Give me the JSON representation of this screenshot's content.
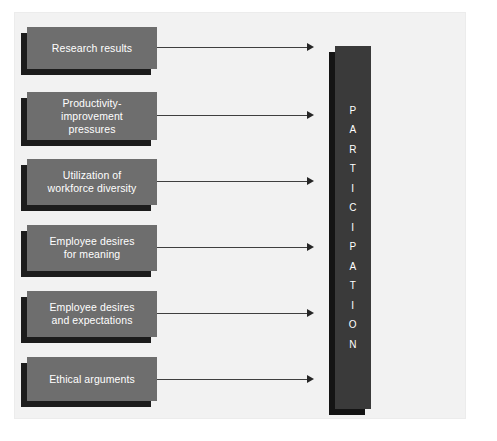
{
  "diagram": {
    "background_color": "#f2f2f2",
    "box_color": "#6e6e6e",
    "box_shadow_color": "#1c1c1c",
    "bar_color": "#3a3a3a",
    "bar_shadow_color": "#141414",
    "text_color": "#ffffff",
    "arrow_color": "#3f3f3f"
  },
  "drivers": [
    {
      "id": "research-results",
      "label": "Research results",
      "lines": [
        "Research results"
      ]
    },
    {
      "id": "productivity-improvement-pressures",
      "label": "Productivity-improvement pressures",
      "lines": [
        "Productivity-",
        "improvement",
        "pressures"
      ]
    },
    {
      "id": "utilization-of-workforce-diversity",
      "label": "Utilization of workforce diversity",
      "lines": [
        "Utilization of",
        "workforce diversity"
      ]
    },
    {
      "id": "employee-desires-for-meaning",
      "label": "Employee desires for meaning",
      "lines": [
        "Employee desires",
        "for meaning"
      ]
    },
    {
      "id": "employee-desires-and-expectations",
      "label": "Employee desires and expectations",
      "lines": [
        "Employee desires",
        "and expectations"
      ]
    },
    {
      "id": "ethical-arguments",
      "label": "Ethical arguments",
      "lines": [
        "Ethical arguments"
      ]
    }
  ],
  "outcome": {
    "id": "participation",
    "label": "PARTICIPATION",
    "letters": [
      "P",
      "A",
      "R",
      "T",
      "I",
      "C",
      "I",
      "P",
      "A",
      "T",
      "I",
      "O",
      "N"
    ],
    "orientation": "vertical-stacked"
  }
}
